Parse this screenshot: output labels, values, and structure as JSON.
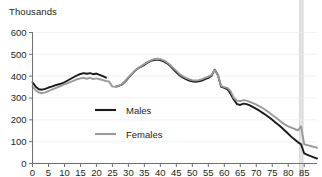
{
  "chart_data": {
    "type": "line",
    "title": "",
    "subtitle": "",
    "ylabel": "Thousands",
    "xlabel": "",
    "ylim": [
      0,
      600
    ],
    "xlim": [
      0,
      89
    ],
    "grid": false,
    "legend_position": "inside-center-left",
    "y_ticks": [
      0,
      100,
      200,
      300,
      400,
      500,
      600
    ],
    "y_tick_labels": [
      "0",
      "100",
      "200",
      "300",
      "400",
      "500",
      "600"
    ],
    "x_ticks": [
      0,
      5,
      10,
      15,
      20,
      25,
      30,
      35,
      40,
      45,
      50,
      55,
      60,
      65,
      70,
      75,
      80,
      85
    ],
    "x_tick_labels": [
      "0",
      "5",
      "10",
      "15",
      "20",
      "25",
      "30",
      "35",
      "40",
      "45",
      "50",
      "55",
      "60",
      "65",
      "70",
      "75",
      "80",
      "85"
    ],
    "annotations": [
      {
        "name": "age-84-highlight-band",
        "type": "vertical-band",
        "x_start": 83.6,
        "x_end": 84.6,
        "color": "#d6d6d6"
      }
    ],
    "series": [
      {
        "name": "Males",
        "color": "#1a1a1a",
        "width": 1.9,
        "x": [
          0,
          1,
          2,
          3,
          4,
          5,
          6,
          7,
          8,
          9,
          10,
          11,
          12,
          13,
          14,
          15,
          16,
          17,
          18,
          19,
          20,
          21,
          22,
          23,
          24,
          25,
          26,
          27,
          28,
          29,
          30,
          31,
          32,
          33,
          34,
          35,
          36,
          37,
          38,
          39,
          40,
          41,
          42,
          43,
          44,
          45,
          46,
          47,
          48,
          49,
          50,
          51,
          52,
          53,
          54,
          55,
          56,
          57,
          58,
          59,
          60,
          61,
          62,
          63,
          64,
          65,
          66,
          67,
          68,
          69,
          70,
          71,
          72,
          73,
          74,
          75,
          76,
          77,
          78,
          79,
          80,
          81,
          82,
          83,
          84,
          85,
          86,
          87,
          88,
          89
        ],
        "values": [
          372,
          352,
          340,
          338,
          342,
          348,
          352,
          358,
          362,
          366,
          372,
          380,
          388,
          396,
          404,
          410,
          414,
          411,
          414,
          409,
          412,
          406,
          400,
          393,
          null,
          null,
          null,
          null,
          null,
          null,
          null,
          null,
          null,
          null,
          null,
          null,
          null,
          null,
          null,
          null,
          null,
          null,
          null,
          null,
          null,
          null,
          null,
          null,
          null,
          null,
          null,
          null,
          null,
          null,
          null,
          null,
          null,
          null,
          null,
          null,
          null,
          null,
          null,
          null,
          null,
          null,
          null,
          null,
          null,
          null,
          null,
          null,
          null,
          null,
          null,
          null,
          null,
          null,
          null,
          null,
          null,
          null,
          null,
          null,
          null,
          null,
          null,
          null,
          null,
          null
        ]
      },
      {
        "name": "Males (continued)",
        "color": "#1a1a1a",
        "width": 1.9,
        "x": [
          26,
          27,
          28,
          29,
          30,
          31,
          32,
          33,
          34,
          35,
          36,
          37,
          38,
          39,
          40,
          41,
          42,
          43,
          44,
          45,
          46,
          47,
          48,
          49,
          50,
          51,
          52,
          53,
          54,
          55,
          56,
          57,
          58,
          59,
          60,
          61,
          62,
          63,
          64,
          65,
          66,
          67,
          68,
          69,
          70,
          71,
          72,
          73,
          74,
          75,
          76,
          77,
          78,
          79,
          80,
          81,
          82,
          83,
          84,
          85,
          86,
          87,
          88,
          89
        ],
        "values": [
          352,
          355,
          362,
          375,
          392,
          408,
          424,
          436,
          444,
          452,
          462,
          470,
          474,
          476,
          474,
          468,
          460,
          448,
          432,
          418,
          404,
          394,
          386,
          380,
          376,
          374,
          376,
          380,
          386,
          392,
          402,
          430,
          405,
          352,
          346,
          340,
          318,
          292,
          272,
          268,
          274,
          272,
          266,
          258,
          250,
          242,
          232,
          222,
          212,
          200,
          188,
          176,
          164,
          150,
          136,
          122,
          110,
          98,
          88,
          46,
          40,
          34,
          28,
          23
        ]
      },
      {
        "name": "Females",
        "color": "#9a9a9a",
        "width": 1.9,
        "x": [
          0,
          1,
          2,
          3,
          4,
          5,
          6,
          7,
          8,
          9,
          10,
          11,
          12,
          13,
          14,
          15,
          16,
          17,
          18,
          19,
          20,
          21,
          22,
          23,
          24,
          25,
          26,
          27,
          28,
          29,
          30,
          31,
          32,
          33,
          34,
          35,
          36,
          37,
          38,
          39,
          40,
          41,
          42,
          43,
          44,
          45,
          46,
          47,
          48,
          49,
          50,
          51,
          52,
          53,
          54,
          55,
          56,
          57,
          58,
          59,
          60,
          61,
          62,
          63,
          64,
          65,
          66,
          67,
          68,
          69,
          70,
          71,
          72,
          73,
          74,
          75,
          76,
          77,
          78,
          79,
          80,
          81,
          82,
          83,
          84,
          85,
          86,
          87,
          88,
          89
        ],
        "values": [
          352,
          335,
          325,
          322,
          326,
          332,
          338,
          344,
          350,
          356,
          362,
          368,
          374,
          380,
          386,
          390,
          392,
          388,
          392,
          387,
          390,
          386,
          382,
          378,
          375,
          352,
          352,
          356,
          364,
          378,
          394,
          410,
          424,
          436,
          446,
          456,
          464,
          472,
          478,
          480,
          478,
          472,
          464,
          452,
          438,
          424,
          410,
          400,
          392,
          386,
          382,
          380,
          382,
          386,
          392,
          398,
          406,
          428,
          404,
          356,
          350,
          346,
          330,
          300,
          288,
          286,
          290,
          288,
          282,
          276,
          270,
          262,
          254,
          244,
          234,
          222,
          212,
          200,
          188,
          178,
          170,
          164,
          158,
          152,
          170,
          88,
          84,
          80,
          76,
          72
        ]
      }
    ]
  },
  "legend": {
    "entries": [
      {
        "label": "Males",
        "color": "#1a1a1a"
      },
      {
        "label": "Females",
        "color": "#9a9a9a"
      }
    ]
  },
  "axis": {
    "unit_label": "Thousands"
  }
}
